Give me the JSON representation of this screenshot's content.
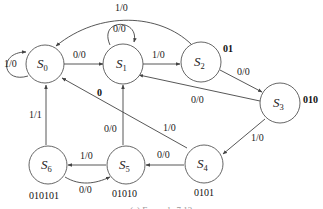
{
  "diagram": {
    "type": "finite-state-machine",
    "states": [
      {
        "id": "S0",
        "base": "S",
        "sub": "0",
        "tag": ""
      },
      {
        "id": "S1",
        "base": "S",
        "sub": "1",
        "tag": "0"
      },
      {
        "id": "S2",
        "base": "S",
        "sub": "2",
        "tag": "01"
      },
      {
        "id": "S3",
        "base": "S",
        "sub": "3",
        "tag": "010"
      },
      {
        "id": "S4",
        "base": "S",
        "sub": "4",
        "tag": "0101"
      },
      {
        "id": "S5",
        "base": "S",
        "sub": "5",
        "tag": "01010"
      },
      {
        "id": "S6",
        "base": "S",
        "sub": "6",
        "tag": "010101"
      }
    ],
    "transitions": [
      {
        "from": "S0",
        "to": "S0",
        "label": "1/0"
      },
      {
        "from": "S0",
        "to": "S1",
        "label": "0/0"
      },
      {
        "from": "S1",
        "to": "S1",
        "label": "0/0"
      },
      {
        "from": "S1",
        "to": "S2",
        "label": "1/0"
      },
      {
        "from": "S2",
        "to": "S0",
        "label": "1/0"
      },
      {
        "from": "S2",
        "to": "S3",
        "label": "0/0"
      },
      {
        "from": "S3",
        "to": "S1",
        "label": "0/0"
      },
      {
        "from": "S3",
        "to": "S4",
        "label": "1/0"
      },
      {
        "from": "S4",
        "to": "S0",
        "label": "1/0"
      },
      {
        "from": "S4",
        "to": "S5",
        "label": "0/0"
      },
      {
        "from": "S5",
        "to": "S1",
        "label": "0/0"
      },
      {
        "from": "S5",
        "to": "S6",
        "label": "1/0"
      },
      {
        "from": "S6",
        "to": "S0",
        "label": "1/1"
      },
      {
        "from": "S6",
        "to": "S5",
        "label": "0/0"
      }
    ],
    "caption": "(a) Example 7.13"
  }
}
